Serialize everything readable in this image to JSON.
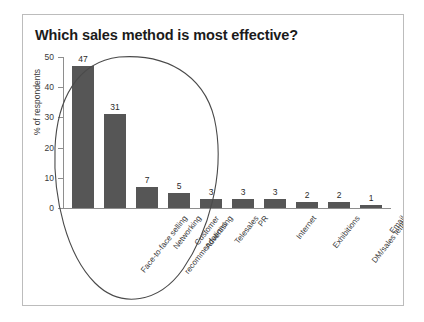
{
  "panel": {
    "title": "Which sales method is most effective?"
  },
  "chart_data": {
    "type": "bar",
    "title": "Which sales method is most effective?",
    "xlabel": "",
    "ylabel": "% of respondents",
    "ylim": [
      0,
      50
    ],
    "ytick_labels": [
      "0",
      "10",
      "20",
      "30",
      "40",
      "50"
    ],
    "ytick_values": [
      0,
      10,
      20,
      30,
      40,
      50
    ],
    "grid": false,
    "legend": null,
    "bar_color": "#565656",
    "categories": [
      "Face-to-face selling",
      "Customer recommendations",
      "Networking",
      "Advertising",
      "Telesales",
      "PR",
      "Internet",
      "Exhibitions",
      "DM/sales letters",
      "Email"
    ],
    "values": [
      47,
      31,
      7,
      5,
      3,
      3,
      3,
      2,
      2,
      1
    ],
    "data_labels": [
      "47",
      "31",
      "7",
      "5",
      "3",
      "3",
      "3",
      "2",
      "2",
      "1"
    ],
    "annotations": [
      {
        "type": "hand-drawn-ellipse",
        "encircles": [
          "Face-to-face selling",
          "Customer recommendations",
          "Networking",
          "Advertising"
        ],
        "color": "#4a4a4a"
      }
    ]
  }
}
